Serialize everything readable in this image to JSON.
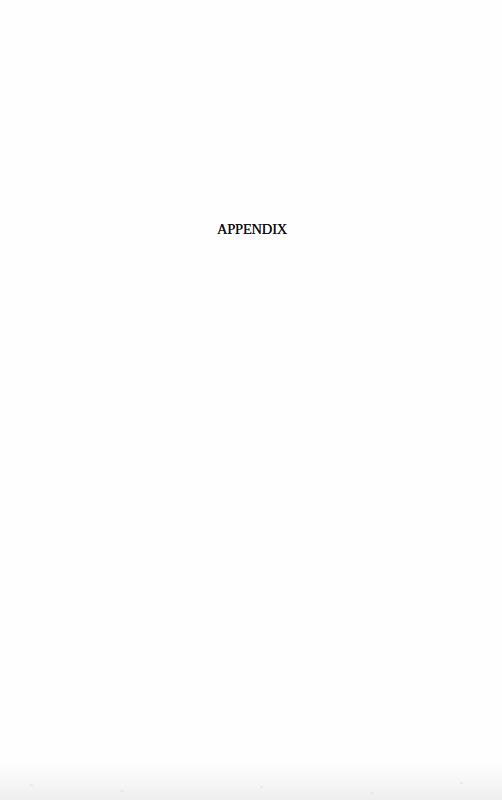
{
  "page": {
    "heading": "APPENDIX",
    "background_color": "#fefefe",
    "text_color": "#111111"
  }
}
